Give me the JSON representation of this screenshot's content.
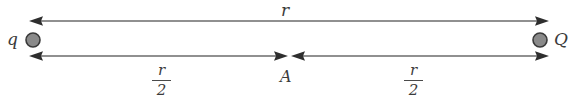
{
  "figure": {
    "type": "physics-diagram",
    "background_color": "#ffffff",
    "line_color": "#6b6b6b",
    "arrow_color": "#2e2e2e",
    "text_color": "#3b3b3b",
    "charge_fill_color": "#8a8a8a",
    "charge_stroke_color": "#3a3a3a"
  },
  "labels": {
    "left_charge": "q",
    "right_charge": "Q",
    "total_distance": "r",
    "midpoint": "A",
    "half_distance_numerator": "r",
    "half_distance_denominator": "2"
  },
  "geometry": {
    "left_charge_x": 33,
    "right_charge_x": 540,
    "charge_y": 40,
    "charge_radius": 7,
    "top_line_y": 21,
    "bottom_line_y": 56,
    "left_tip_x": 30,
    "right_tip_x": 548,
    "midpoint_left_tip_x": 287,
    "midpoint_right_tip_x": 292
  }
}
